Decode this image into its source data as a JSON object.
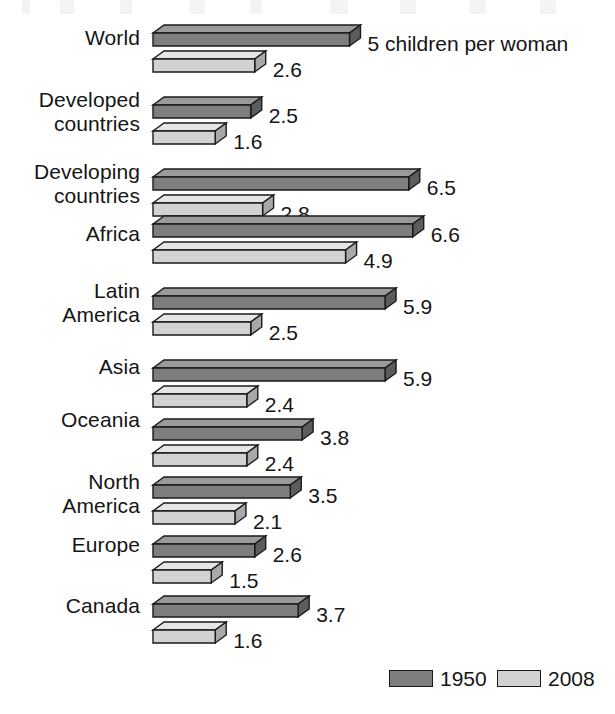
{
  "chart_data": {
    "type": "bar",
    "orientation": "horizontal",
    "title": "",
    "xlabel": "",
    "ylabel": "",
    "unit_note": "5 children per woman",
    "categories": [
      "World",
      "Developed countries",
      "Developing countries",
      "Africa",
      "Latin America",
      "Asia",
      "Oceania",
      "North America",
      "Europe",
      "Canada"
    ],
    "series": [
      {
        "name": "1950",
        "color": "#7e7e7e",
        "values": [
          5.0,
          2.5,
          6.5,
          6.6,
          5.9,
          5.9,
          3.8,
          3.5,
          2.6,
          3.7
        ]
      },
      {
        "name": "2008",
        "color": "#d2d2d2",
        "values": [
          2.6,
          1.6,
          2.8,
          4.9,
          2.5,
          2.4,
          2.4,
          2.1,
          1.5,
          1.6
        ]
      }
    ],
    "value_labels": {
      "1950": [
        "5 children per woman",
        "2.5",
        "6.5",
        "6.6",
        "5.9",
        "5.9",
        "3.8",
        "3.5",
        "2.6",
        "3.7"
      ],
      "2008": [
        "2.6",
        "1.6",
        "2.8",
        "4.9",
        "2.5",
        "2.4",
        "2.4",
        "2.1",
        "1.5",
        "1.6"
      ]
    },
    "xlim": [
      0,
      6.6
    ],
    "grid": false,
    "legend_position": "bottom-right"
  },
  "rows": [
    {
      "label_line1": "World",
      "label_line2": "",
      "v1950": 5.0,
      "v2008": 2.6,
      "t1950": "5 children per woman",
      "t2008": "2.6"
    },
    {
      "label_line1": "Developed",
      "label_line2": "countries",
      "v1950": 2.5,
      "v2008": 1.6,
      "t1950": "2.5",
      "t2008": "1.6"
    },
    {
      "label_line1": "Developing",
      "label_line2": "countries",
      "v1950": 6.5,
      "v2008": 2.8,
      "t1950": "6.5",
      "t2008": "2.8"
    },
    {
      "label_line1": "Africa",
      "label_line2": "",
      "v1950": 6.6,
      "v2008": 4.9,
      "t1950": "6.6",
      "t2008": "4.9"
    },
    {
      "label_line1": "Latin",
      "label_line2": "America",
      "v1950": 5.9,
      "v2008": 2.5,
      "t1950": "5.9",
      "t2008": "2.5"
    },
    {
      "label_line1": "Asia",
      "label_line2": "",
      "v1950": 5.9,
      "v2008": 2.4,
      "t1950": "5.9",
      "t2008": "2.4"
    },
    {
      "label_line1": "Oceania",
      "label_line2": "",
      "v1950": 3.8,
      "v2008": 2.4,
      "t1950": "3.8",
      "t2008": "2.4"
    },
    {
      "label_line1": "North",
      "label_line2": "America",
      "v1950": 3.5,
      "v2008": 2.1,
      "t1950": "3.5",
      "t2008": "2.1"
    },
    {
      "label_line1": "Europe",
      "label_line2": "",
      "v1950": 2.6,
      "v2008": 1.5,
      "t1950": "2.6",
      "t2008": "1.5"
    },
    {
      "label_line1": "Canada",
      "label_line2": "",
      "v1950": 3.7,
      "v2008": 1.6,
      "t1950": "3.7",
      "t2008": "1.6"
    }
  ],
  "legend": {
    "items": [
      {
        "label": "1950",
        "color": "#7e7e7e"
      },
      {
        "label": "2008",
        "color": "#d2d2d2"
      }
    ]
  },
  "colors": {
    "series_1950_front": "#7e7e7e",
    "series_1950_top": "#9a9a9a",
    "series_1950_side": "#5c5c5c",
    "series_2008_front": "#d2d2d2",
    "series_2008_top": "#e6e6e6",
    "series_2008_side": "#a8a8a8",
    "outline": "#1a1a1a",
    "text": "#151515",
    "background": "#ffffff"
  }
}
